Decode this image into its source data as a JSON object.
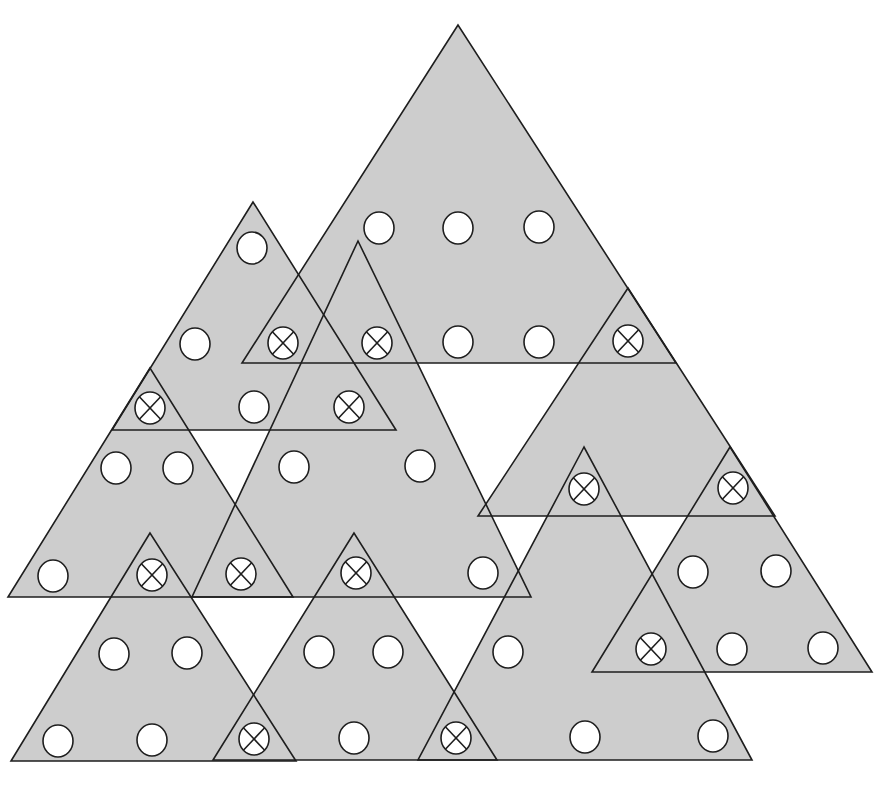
{
  "diagram": {
    "width": 881,
    "height": 785,
    "colors": {
      "background": "#ffffff",
      "triangle_fill": "#cdcdcd",
      "stroke": "#1e1e1e",
      "circle_fill": "#ffffff"
    },
    "stroke_width": 1.6,
    "circle_radius_x": 15,
    "circle_radius_y": 16,
    "triangles": [
      {
        "id": "A",
        "points": [
          [
            458,
            25
          ],
          [
            242,
            363
          ],
          [
            676,
            363
          ]
        ]
      },
      {
        "id": "B",
        "points": [
          [
            253,
            202
          ],
          [
            112,
            430
          ],
          [
            396,
            430
          ]
        ]
      },
      {
        "id": "C",
        "points": [
          [
            150,
            368
          ],
          [
            8,
            597
          ],
          [
            293,
            597
          ]
        ]
      },
      {
        "id": "D",
        "points": [
          [
            358,
            241
          ],
          [
            192,
            597
          ],
          [
            531,
            597
          ]
        ]
      },
      {
        "id": "E",
        "points": [
          [
            628,
            288
          ],
          [
            478,
            516
          ],
          [
            775,
            516
          ]
        ]
      },
      {
        "id": "F",
        "points": [
          [
            584,
            447
          ],
          [
            418,
            760
          ],
          [
            752,
            760
          ]
        ]
      },
      {
        "id": "G",
        "points": [
          [
            730,
            447
          ],
          [
            592,
            672
          ],
          [
            872,
            672
          ]
        ]
      },
      {
        "id": "H",
        "points": [
          [
            150,
            533
          ],
          [
            11,
            761
          ],
          [
            296,
            761
          ]
        ]
      },
      {
        "id": "I",
        "points": [
          [
            354,
            533
          ],
          [
            213,
            760
          ],
          [
            497,
            760
          ]
        ]
      }
    ],
    "circles": [
      {
        "x": 379,
        "y": 228,
        "type": "open"
      },
      {
        "x": 458,
        "y": 228,
        "type": "open"
      },
      {
        "x": 539,
        "y": 227,
        "type": "open"
      },
      {
        "x": 252,
        "y": 248,
        "type": "open"
      },
      {
        "x": 195,
        "y": 344,
        "type": "open"
      },
      {
        "x": 283,
        "y": 343,
        "type": "crossed"
      },
      {
        "x": 377,
        "y": 343,
        "type": "crossed"
      },
      {
        "x": 458,
        "y": 342,
        "type": "open"
      },
      {
        "x": 539,
        "y": 342,
        "type": "open"
      },
      {
        "x": 628,
        "y": 341,
        "type": "crossed"
      },
      {
        "x": 150,
        "y": 408,
        "type": "crossed"
      },
      {
        "x": 254,
        "y": 407,
        "type": "open"
      },
      {
        "x": 349,
        "y": 407,
        "type": "crossed"
      },
      {
        "x": 116,
        "y": 468,
        "type": "open"
      },
      {
        "x": 178,
        "y": 468,
        "type": "open"
      },
      {
        "x": 294,
        "y": 467,
        "type": "open"
      },
      {
        "x": 420,
        "y": 466,
        "type": "open"
      },
      {
        "x": 584,
        "y": 489,
        "type": "crossed"
      },
      {
        "x": 733,
        "y": 488,
        "type": "crossed"
      },
      {
        "x": 693,
        "y": 572,
        "type": "open"
      },
      {
        "x": 776,
        "y": 571,
        "type": "open"
      },
      {
        "x": 53,
        "y": 576,
        "type": "open"
      },
      {
        "x": 152,
        "y": 575,
        "type": "crossed"
      },
      {
        "x": 241,
        "y": 574,
        "type": "crossed"
      },
      {
        "x": 356,
        "y": 573,
        "type": "crossed"
      },
      {
        "x": 483,
        "y": 573,
        "type": "open"
      },
      {
        "x": 114,
        "y": 654,
        "type": "open"
      },
      {
        "x": 187,
        "y": 653,
        "type": "open"
      },
      {
        "x": 319,
        "y": 652,
        "type": "open"
      },
      {
        "x": 388,
        "y": 652,
        "type": "open"
      },
      {
        "x": 508,
        "y": 652,
        "type": "open"
      },
      {
        "x": 651,
        "y": 649,
        "type": "crossed"
      },
      {
        "x": 732,
        "y": 649,
        "type": "open"
      },
      {
        "x": 823,
        "y": 648,
        "type": "open"
      },
      {
        "x": 58,
        "y": 741,
        "type": "open"
      },
      {
        "x": 152,
        "y": 740,
        "type": "open"
      },
      {
        "x": 254,
        "y": 739,
        "type": "crossed"
      },
      {
        "x": 354,
        "y": 738,
        "type": "open"
      },
      {
        "x": 456,
        "y": 738,
        "type": "crossed"
      },
      {
        "x": 585,
        "y": 737,
        "type": "open"
      },
      {
        "x": 713,
        "y": 736,
        "type": "open"
      }
    ]
  }
}
